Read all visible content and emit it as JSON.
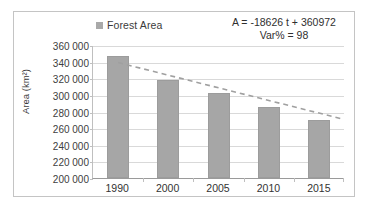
{
  "chart_data": {
    "type": "bar",
    "title": "",
    "xlabel": "",
    "ylabel": "Area (km²)",
    "categories": [
      "1990",
      "2000",
      "2005",
      "2010",
      "2015"
    ],
    "values": [
      347000,
      318000,
      302000,
      285000,
      270000
    ],
    "series": [
      {
        "name": "Forest Area",
        "values": [
          347000,
          318000,
          302000,
          285000,
          270000
        ]
      }
    ],
    "ylim": [
      200000,
      360000
    ],
    "ytick_step": 20000,
    "ytick_labels": [
      "360 000",
      "340 000",
      "320 000",
      "300 000",
      "280 000",
      "260 000",
      "240 000",
      "220 000",
      "200 000"
    ],
    "grid": true,
    "legend": {
      "position": "top-center",
      "entries": [
        "Forest Area"
      ]
    },
    "annotations": {
      "equation": "A = -18626 t + 360972",
      "variance": "Var% = 98"
    },
    "trendline": {
      "type": "linear-dashed",
      "slope": -18626,
      "intercept": 360972,
      "start_value": 340000,
      "end_value": 272000,
      "color": "#a0a0a0"
    }
  },
  "legend": {
    "label": "Forest Area",
    "swatch_color": "#a9a9a9"
  },
  "equation": {
    "line1": "A = -18626 t + 360972",
    "line2": "Var% = 98"
  },
  "axes": {
    "y_title": "Area (km²)",
    "y_ticks": [
      "360 000",
      "340 000",
      "320 000",
      "300 000",
      "280 000",
      "260 000",
      "240 000",
      "220 000",
      "200 000"
    ],
    "x_ticks": [
      "1990",
      "2000",
      "2005",
      "2010",
      "2015"
    ]
  },
  "colors": {
    "bar_fill": "#a6a6a6",
    "bar_stroke": "#9c9c9c",
    "gridline": "#d9d9d9",
    "frame_border": "#c4c4c4",
    "trendline": "#a0a0a0",
    "text": "#333333",
    "background": "#ffffff"
  }
}
